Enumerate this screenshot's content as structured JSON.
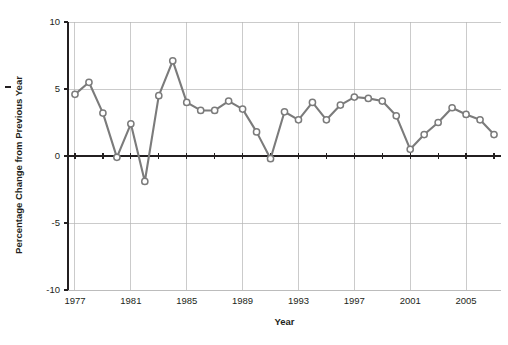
{
  "chart_data": {
    "type": "line",
    "title": "",
    "xlabel": "Year",
    "ylabel": "Percentage Change from Previous Year",
    "xlim": [
      1976.5,
      2007.5
    ],
    "ylim": [
      -10,
      10
    ],
    "ytick_labels": [
      "10",
      "5",
      "0",
      "-5",
      "-10"
    ],
    "ytick_values": [
      10,
      5,
      0,
      -5,
      -10
    ],
    "xtick_labels": [
      "1977",
      "1981",
      "1985",
      "1989",
      "1993",
      "1997",
      "2001",
      "2005"
    ],
    "xtick_values": [
      1977,
      1981,
      1985,
      1989,
      1993,
      1997,
      2001,
      2005
    ],
    "grid": "both",
    "legend": "none",
    "marker": "open-circle",
    "line_color": "#7b7b7b",
    "marker_fill": "#ffffff",
    "grid_color": "#b5b5b5",
    "axis_color": "#231f20",
    "x": [
      1977,
      1978,
      1979,
      1980,
      1981,
      1982,
      1983,
      1984,
      1985,
      1986,
      1987,
      1988,
      1989,
      1990,
      1991,
      1992,
      1993,
      1994,
      1995,
      1996,
      1997,
      1998,
      1999,
      2000,
      2001,
      2002,
      2003,
      2004,
      2005,
      2006,
      2007
    ],
    "values": [
      4.6,
      5.5,
      3.2,
      -0.1,
      2.4,
      -1.9,
      4.5,
      7.1,
      4.0,
      3.4,
      3.4,
      4.1,
      3.5,
      1.8,
      -0.2,
      3.3,
      2.7,
      4.0,
      2.7,
      3.8,
      4.4,
      4.3,
      4.1,
      3.0,
      0.5,
      1.6,
      2.5,
      3.6,
      3.1,
      2.7,
      1.6
    ],
    "series": [
      {
        "name": "Percentage Change from Previous Year",
        "values": [
          4.6,
          5.5,
          3.2,
          -0.1,
          2.4,
          -1.9,
          4.5,
          7.1,
          4.0,
          3.4,
          3.4,
          4.1,
          3.5,
          1.8,
          -0.2,
          3.3,
          2.7,
          4.0,
          2.7,
          3.8,
          4.4,
          4.3,
          4.1,
          3.0,
          0.5,
          1.6,
          2.5,
          3.6,
          3.1,
          2.7,
          1.6
        ]
      }
    ]
  }
}
